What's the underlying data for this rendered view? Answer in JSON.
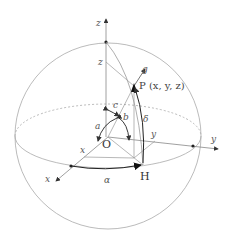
{
  "diagram": {
    "labels": {
      "z_axis": "z",
      "z_coord": "z",
      "y_axis": "y",
      "y_coord": "y",
      "x_axis": "x",
      "x_coord": "x",
      "origin": "O",
      "point_p": "P (x, y, z)",
      "point_h": "H",
      "gravity": "g",
      "angle_a": "a",
      "angle_b": "b",
      "angle_c": "c",
      "angle_alpha": "α",
      "angle_delta": "δ"
    },
    "colors": {
      "line": "#999999",
      "dark": "#222222"
    }
  }
}
